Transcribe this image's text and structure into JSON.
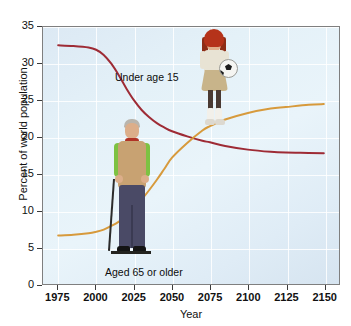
{
  "chart_data": {
    "type": "line",
    "title": "",
    "xlabel": "Year",
    "ylabel": "Percent of world population",
    "xlim": [
      1965,
      2160
    ],
    "ylim": [
      0,
      35
    ],
    "xticks": [
      1975,
      2000,
      2025,
      2050,
      2075,
      2100,
      2125,
      2150
    ],
    "yticks": [
      0,
      5,
      10,
      15,
      20,
      25,
      30,
      35
    ],
    "grid": true,
    "legend_position": "inline-annotations",
    "x": [
      1975,
      1985,
      1995,
      2000,
      2005,
      2010,
      2015,
      2020,
      2025,
      2030,
      2035,
      2040,
      2045,
      2050,
      2060,
      2070,
      2075,
      2085,
      2100,
      2115,
      2125,
      2140,
      2150
    ],
    "series": [
      {
        "name": "Under age 15",
        "color": "#9e2b35",
        "annotation": "Under age 15",
        "values": [
          32.5,
          32.4,
          32.2,
          31.9,
          31.2,
          30.0,
          28.4,
          26.6,
          25.0,
          23.7,
          22.7,
          21.9,
          21.3,
          20.8,
          20.1,
          19.5,
          19.3,
          18.8,
          18.3,
          18.0,
          17.9,
          17.85,
          17.8
        ]
      },
      {
        "name": "Aged 65 or older",
        "color": "#d79a3c",
        "annotation": "Aged 65 or older",
        "values": [
          6.6,
          6.7,
          6.9,
          7.1,
          7.4,
          7.9,
          8.5,
          9.3,
          10.3,
          11.5,
          12.8,
          14.2,
          15.7,
          17.2,
          19.2,
          20.9,
          21.5,
          22.4,
          23.3,
          23.9,
          24.1,
          24.4,
          24.5
        ]
      }
    ],
    "annotations": [
      {
        "name": "crossover",
        "x": 2073,
        "y": 19.4,
        "note": "curves intersect near 2073 at about 19.4 percent"
      }
    ]
  },
  "axes": {
    "y_title": "Percent of world population",
    "x_title": "Year",
    "y_tick_labels": [
      "0",
      "5",
      "10",
      "15",
      "20",
      "25",
      "30",
      "35"
    ],
    "x_tick_labels": [
      "1975",
      "2000",
      "2025",
      "2050",
      "2075",
      "2100",
      "2125",
      "2150"
    ]
  },
  "labels": {
    "under15": "Under age 15",
    "aged65": "Aged 65 or older"
  },
  "illustrations": {
    "girl": "girl-with-soccer-ball-photo",
    "man": "elderly-man-with-cane-photo"
  },
  "colors": {
    "under15_line": "#9e2b35",
    "aged65_line": "#d79a3c",
    "plot_background": "#e4f1f8",
    "grid": "#ffffff",
    "frame": "#7f7f7f",
    "text": "#111111"
  }
}
